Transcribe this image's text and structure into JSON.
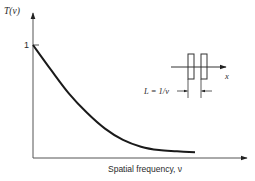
{
  "chart_data": {
    "type": "line",
    "title": "",
    "xlabel": "Spatial frequency, ν",
    "ylabel": "T(ν)",
    "y_ticks": [
      {
        "value": 1,
        "label": "1"
      }
    ],
    "x_ticks": [],
    "xlim": [
      0,
      1.0
    ],
    "ylim": [
      0,
      1.2
    ],
    "grid": false,
    "legend": "none",
    "series": [
      {
        "name": "T(ν)",
        "x": [
          0,
          0.1,
          0.2,
          0.3,
          0.4,
          0.5,
          0.6,
          0.7,
          0.8,
          0.9
        ],
        "y": [
          1.0,
          0.78,
          0.57,
          0.4,
          0.26,
          0.16,
          0.1,
          0.07,
          0.06,
          0.05
        ]
      }
    ],
    "inset": {
      "description": "Bar target: two bars straddling an x axis, spacing marked L",
      "axis_label": "x",
      "annotation": "L = 1/ν"
    }
  }
}
